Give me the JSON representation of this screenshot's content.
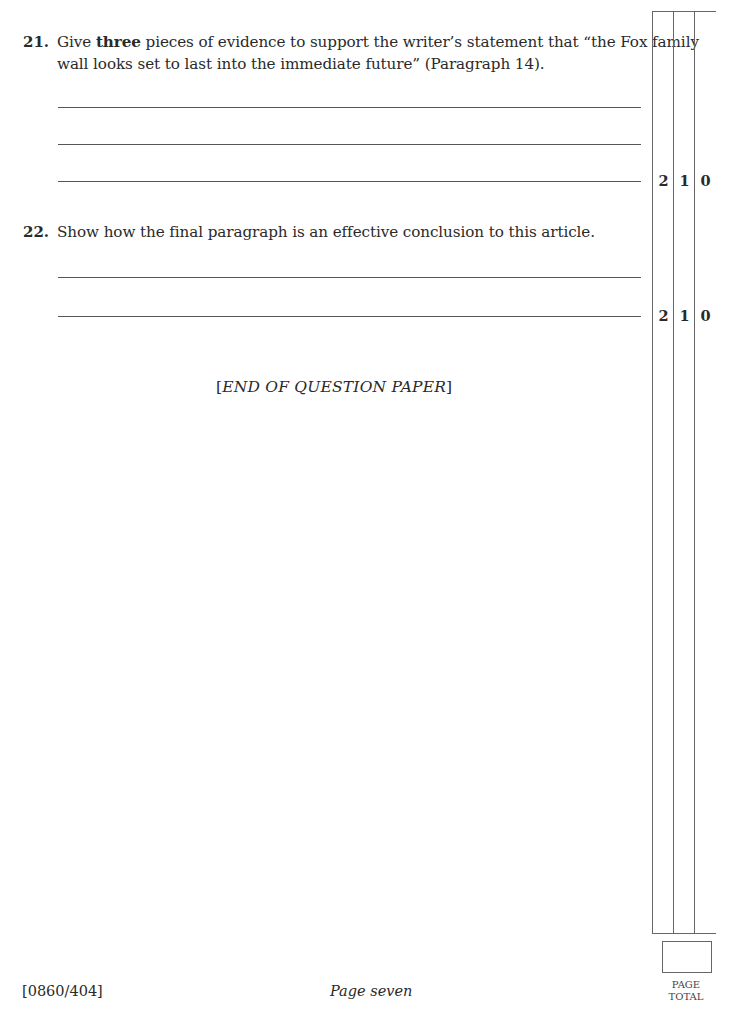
{
  "questions": [
    {
      "number": "21.",
      "text_before_bold": "Give ",
      "bold": "three",
      "text_after_bold_line1": " pieces of evidence to support the writer’s statement that “the Fox family",
      "line2": "wall looks set to last into the immediate future” (Paragraph 14).",
      "answer_lines": 3,
      "marks": [
        "2",
        "1",
        "0"
      ]
    },
    {
      "number": "22.",
      "text": "Show how the final paragraph is an effective conclusion to this article.",
      "answer_lines": 2,
      "marks": [
        "2",
        "1",
        "0"
      ]
    }
  ],
  "end_note": "[END OF QUESTION PAPER]",
  "end_note_parts": {
    "open": "[",
    "text": "END OF QUESTION PAPER",
    "close": "]"
  },
  "footer": {
    "code": "[0860/404]",
    "page": "Page seven",
    "page_total_line1": "PAGE",
    "page_total_line2": "TOTAL"
  }
}
